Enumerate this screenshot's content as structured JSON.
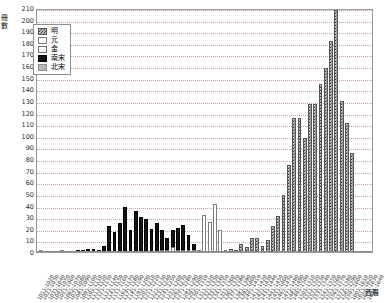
{
  "axis": {
    "y_title": "冊數",
    "x_title": "西曆",
    "y_ticks": [
      210,
      200,
      190,
      180,
      170,
      160,
      150,
      140,
      130,
      120,
      110,
      100,
      90,
      80,
      70,
      60,
      50,
      40,
      30,
      20,
      10,
      0
    ]
  },
  "legend": {
    "items": [
      {
        "label": "明",
        "key": "ming",
        "color": "#3a3a3a"
      },
      {
        "label": "元",
        "key": "yuan",
        "color": "#8a8a8a"
      },
      {
        "label": "金",
        "key": "jin",
        "color": "#ffffff"
      },
      {
        "label": "南宋",
        "key": "nansong",
        "color": "#141414"
      },
      {
        "label": "北宋",
        "key": "beisong",
        "color": "#b9b9b9"
      }
    ]
  },
  "chart_data": {
    "type": "bar",
    "title": "",
    "xlabel": "西曆",
    "ylabel": "冊數",
    "ylim": [
      0,
      210
    ],
    "ytick_step": 10,
    "grid": true,
    "legend_position": "top-left",
    "categories": [
      "1011-1020",
      "1021-1030",
      "1031-1040",
      "1041-1050",
      "1051-1060",
      "1061-1070",
      "1071-1080",
      "1081-1090",
      "1091-1100",
      "1101-1110",
      "1111-1120",
      "1121-1130",
      "1131-1140",
      "1141-1150",
      "1151-1160",
      "1161-1170",
      "1171-1180",
      "1181-1190",
      "1191-1200",
      "1201-1210",
      "1211-1220",
      "1221-1230",
      "1231-1240",
      "1241-1250",
      "1251-1260",
      "1261-1270",
      "1271-1280",
      "1281-1290",
      "1291-1300",
      "1301-1310",
      "1311-1320",
      "1321-1330",
      "1331-1340",
      "1341-1350",
      "1351-1360",
      "1361-1370",
      "1371-1380",
      "1381-1390",
      "1391-1400",
      "1401-1410",
      "1411-1420",
      "1421-1430",
      "1431-1440",
      "1441-1450",
      "1451-1460",
      "1461-1470",
      "1471-1480",
      "1481-1490",
      "1491-1500",
      "1501-1510",
      "1511-1520",
      "1521-1530",
      "1531-1540",
      "1541-1550",
      "1551-1560",
      "1561-1570",
      "1571-1580",
      "1581-1590",
      "1591-1600",
      "1601-1610",
      "1611-1620",
      "1621-1630",
      "1631-1640"
    ],
    "series": [
      {
        "name": "北宋",
        "key": "beisong",
        "values": [
          1,
          0,
          0,
          0,
          2,
          0,
          0,
          0,
          0,
          0,
          0,
          0,
          0,
          0,
          0,
          0,
          0,
          0,
          0,
          0,
          0,
          0,
          0,
          0,
          0,
          0,
          0,
          0,
          0,
          0,
          0,
          0,
          0,
          0,
          0,
          0,
          0,
          0,
          0,
          0,
          0,
          0,
          0,
          0,
          0,
          0,
          0,
          0,
          0,
          0,
          0,
          0,
          0,
          0,
          0,
          0,
          0,
          0,
          0,
          0,
          0,
          0,
          0
        ]
      },
      {
        "name": "南宋",
        "key": "nansong",
        "values": [
          0,
          0,
          0,
          0,
          0,
          0,
          0,
          1,
          2,
          3,
          3,
          2,
          5,
          22,
          17,
          25,
          39,
          19,
          35,
          30,
          28,
          20,
          25,
          17,
          10,
          15,
          19,
          21,
          13,
          5,
          0,
          0,
          0,
          0,
          0,
          0,
          0,
          0,
          0,
          0,
          0,
          0,
          0,
          0,
          0,
          0,
          0,
          0,
          0,
          0,
          0,
          0,
          0,
          0,
          0,
          0,
          0,
          0,
          0,
          0,
          0,
          0,
          0
        ]
      },
      {
        "name": "金",
        "key": "jin",
        "values": [
          0,
          0,
          0,
          0,
          0,
          0,
          0,
          0,
          0,
          0,
          0,
          0,
          0,
          0,
          0,
          0,
          0,
          0,
          0,
          0,
          0,
          0,
          0,
          1,
          2,
          4,
          2,
          2,
          1,
          0,
          0,
          0,
          0,
          0,
          0,
          0,
          0,
          0,
          0,
          0,
          0,
          0,
          0,
          0,
          0,
          0,
          0,
          0,
          0,
          0,
          0,
          0,
          0,
          0,
          0,
          0,
          0,
          0,
          0,
          0,
          0,
          0,
          0
        ]
      },
      {
        "name": "元",
        "key": "yuan",
        "values": [
          0,
          0,
          0,
          0,
          0,
          0,
          0,
          0,
          0,
          0,
          0,
          0,
          0,
          0,
          0,
          0,
          0,
          0,
          0,
          0,
          0,
          0,
          0,
          0,
          0,
          0,
          0,
          0,
          0,
          2,
          1,
          32,
          26,
          41,
          19,
          1,
          0,
          0,
          0,
          0,
          0,
          0,
          0,
          0,
          0,
          0,
          0,
          0,
          0,
          0,
          0,
          0,
          0,
          0,
          0,
          0,
          0,
          0,
          0,
          0,
          0,
          0,
          0
        ]
      },
      {
        "name": "明",
        "key": "ming",
        "values": [
          0,
          0,
          0,
          0,
          0,
          0,
          0,
          0,
          0,
          0,
          0,
          0,
          0,
          0,
          0,
          0,
          0,
          0,
          0,
          0,
          0,
          0,
          0,
          0,
          0,
          0,
          0,
          0,
          0,
          0,
          0,
          0,
          0,
          0,
          0,
          0,
          3,
          2,
          7,
          4,
          12,
          12,
          5,
          10,
          22,
          31,
          49,
          75,
          115,
          115,
          98,
          127,
          127,
          145,
          158,
          182,
          208,
          130,
          111,
          85,
          0,
          0,
          0
        ]
      }
    ]
  }
}
